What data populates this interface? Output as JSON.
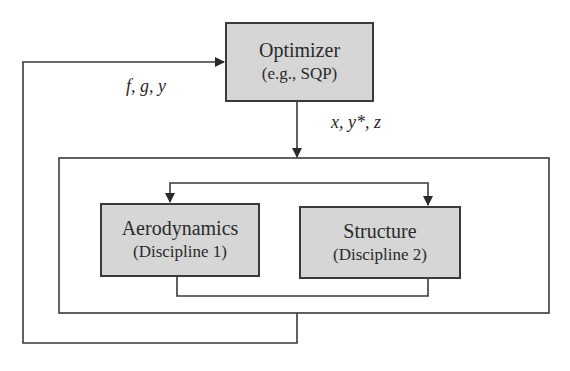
{
  "diagram": {
    "nodes": {
      "optimizer": {
        "title": "Optimizer",
        "subtitle": "(e.g., SQP)"
      },
      "aerodynamics": {
        "title": "Aerodynamics",
        "subtitle": "(Discipline 1)"
      },
      "structure": {
        "title": "Structure",
        "subtitle": "(Discipline 2)"
      }
    },
    "edges": {
      "feedback_label": "f, g, y",
      "design_vars_label": "x, y*, z"
    },
    "colors": {
      "box_fill": "#d6d6d6",
      "stroke": "#3a3a3a",
      "background": "#ffffff"
    }
  }
}
